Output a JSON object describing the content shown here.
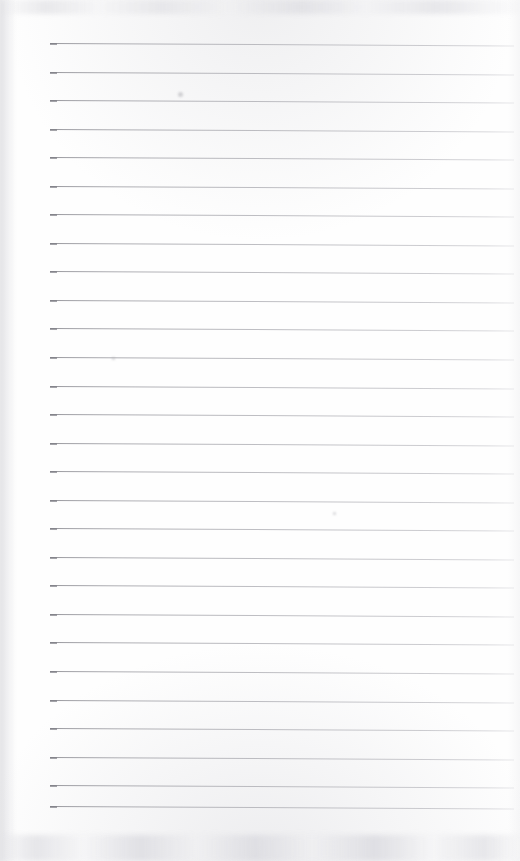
{
  "document": {
    "kind": "scanned-ruled-notepad-page",
    "title": "Blank Ruled Notepad Page",
    "content_text": "",
    "is_blank": true,
    "width_px": 520,
    "height_px": 861
  },
  "paper": {
    "background_color": "#fefefe",
    "tint_color": "#f7f7f8",
    "edge_shadow_color": "#c6c6cc"
  },
  "ruling": {
    "line_count": 28,
    "line_color": "#9a9a9e",
    "line_cap_color": "#7e7e85",
    "line_thickness_px": 1,
    "first_line_y": 43,
    "line_spacing_px": 28.55,
    "line_start_x": 50,
    "line_end_x": 514,
    "line_length_px": 464,
    "slope_deg": 0.3,
    "lines": [
      {
        "index": 1,
        "y": 43,
        "x1": 50,
        "x2": 514
      },
      {
        "index": 2,
        "y": 72,
        "x1": 50,
        "x2": 514
      },
      {
        "index": 3,
        "y": 100,
        "x1": 50,
        "x2": 514
      },
      {
        "index": 4,
        "y": 129,
        "x1": 50,
        "x2": 514
      },
      {
        "index": 5,
        "y": 157,
        "x1": 50,
        "x2": 514
      },
      {
        "index": 6,
        "y": 186,
        "x1": 50,
        "x2": 514
      },
      {
        "index": 7,
        "y": 214,
        "x1": 50,
        "x2": 514
      },
      {
        "index": 8,
        "y": 243,
        "x1": 50,
        "x2": 514
      },
      {
        "index": 9,
        "y": 271,
        "x1": 50,
        "x2": 514
      },
      {
        "index": 10,
        "y": 300,
        "x1": 50,
        "x2": 514
      },
      {
        "index": 11,
        "y": 328,
        "x1": 50,
        "x2": 514
      },
      {
        "index": 12,
        "y": 357,
        "x1": 50,
        "x2": 514
      },
      {
        "index": 13,
        "y": 386,
        "x1": 50,
        "x2": 514
      },
      {
        "index": 14,
        "y": 414,
        "x1": 50,
        "x2": 514
      },
      {
        "index": 15,
        "y": 443,
        "x1": 50,
        "x2": 514
      },
      {
        "index": 16,
        "y": 471,
        "x1": 50,
        "x2": 514
      },
      {
        "index": 17,
        "y": 500,
        "x1": 50,
        "x2": 514
      },
      {
        "index": 18,
        "y": 528,
        "x1": 50,
        "x2": 514
      },
      {
        "index": 19,
        "y": 557,
        "x1": 50,
        "x2": 514
      },
      {
        "index": 20,
        "y": 585,
        "x1": 50,
        "x2": 514
      },
      {
        "index": 21,
        "y": 614,
        "x1": 50,
        "x2": 514
      },
      {
        "index": 22,
        "y": 642,
        "x1": 50,
        "x2": 514
      },
      {
        "index": 23,
        "y": 671,
        "x1": 50,
        "x2": 514
      },
      {
        "index": 24,
        "y": 700,
        "x1": 50,
        "x2": 514
      },
      {
        "index": 25,
        "y": 728,
        "x1": 50,
        "x2": 514
      },
      {
        "index": 26,
        "y": 757,
        "x1": 50,
        "x2": 514
      },
      {
        "index": 27,
        "y": 785,
        "x1": 50,
        "x2": 514
      },
      {
        "index": 28,
        "y": 806,
        "x1": 50,
        "x2": 514
      }
    ]
  },
  "artifacts": {
    "specks": [
      {
        "x": 178,
        "y": 92,
        "size": 5
      },
      {
        "x": 112,
        "y": 357,
        "size": 3
      },
      {
        "x": 333,
        "y": 512,
        "size": 3
      }
    ]
  }
}
